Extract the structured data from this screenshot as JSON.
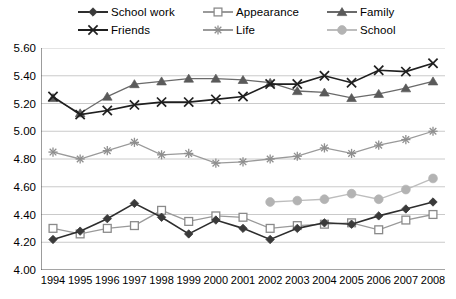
{
  "chart_data": {
    "type": "line",
    "title": "",
    "subtitle": "",
    "xlabel": "",
    "ylabel": "",
    "x": [
      1994,
      1995,
      1996,
      1997,
      1998,
      1999,
      2000,
      2001,
      2002,
      2003,
      2004,
      2005,
      2006,
      2007,
      2008
    ],
    "categories": [
      "1994",
      "1995",
      "1996",
      "1997",
      "1998",
      "1999",
      "2000",
      "2001",
      "2002",
      "2003",
      "2004",
      "2005",
      "2006",
      "2007",
      "2008"
    ],
    "ylim": [
      4.0,
      5.6
    ],
    "yticks": [
      "4.00",
      "4.20",
      "4.40",
      "4.60",
      "4.80",
      "5.00",
      "5.20",
      "5.40",
      "5.60"
    ],
    "ytick_values": [
      4.0,
      4.2,
      4.4,
      4.6,
      4.8,
      5.0,
      5.2,
      5.4,
      5.6
    ],
    "grid": "horizontal",
    "legend_position": "top",
    "series": [
      {
        "name": "School work",
        "marker": "diamond",
        "color": "#3a3a3a",
        "line_color": "#2e2e2e",
        "values": [
          4.22,
          4.28,
          4.37,
          4.48,
          4.38,
          4.26,
          4.36,
          4.3,
          4.22,
          4.3,
          4.34,
          4.33,
          4.39,
          4.44,
          4.49
        ]
      },
      {
        "name": "Appearance",
        "marker": "open-square",
        "color": "#8a8a8a",
        "line_color": "#9a9a9a",
        "values": [
          4.3,
          4.26,
          4.3,
          4.32,
          4.43,
          4.35,
          4.39,
          4.38,
          4.3,
          4.32,
          4.33,
          4.34,
          4.29,
          4.36,
          4.4
        ]
      },
      {
        "name": "Family",
        "marker": "triangle",
        "color": "#5a5a5a",
        "line_color": "#6a6a6a",
        "values": [
          5.24,
          5.13,
          5.25,
          5.34,
          5.36,
          5.38,
          5.38,
          5.37,
          5.35,
          5.29,
          5.28,
          5.24,
          5.27,
          5.31,
          5.36
        ]
      },
      {
        "name": "Friends",
        "marker": "cross-x",
        "color": "#1f1f1f",
        "line_color": "#1f1f1f",
        "values": [
          5.25,
          5.12,
          5.15,
          5.19,
          5.21,
          5.21,
          5.23,
          5.25,
          5.34,
          5.34,
          5.4,
          5.35,
          5.44,
          5.43,
          5.49
        ]
      },
      {
        "name": "Life",
        "marker": "asterisk",
        "color": "#8f8f8f",
        "line_color": "#9a9a9a",
        "values": [
          4.85,
          4.8,
          4.86,
          4.92,
          4.83,
          4.84,
          4.77,
          4.78,
          4.8,
          4.82,
          4.88,
          4.84,
          4.9,
          4.94,
          5.0
        ]
      },
      {
        "name": "School",
        "marker": "circle",
        "color": "#b3b3b3",
        "line_color": "#bdbdbd",
        "values": [
          null,
          null,
          null,
          null,
          null,
          null,
          null,
          null,
          4.49,
          4.5,
          4.51,
          4.55,
          4.51,
          4.58,
          4.66
        ]
      }
    ]
  },
  "legend": {
    "items": [
      {
        "label": "School work",
        "marker": "diamond",
        "icon": "diamond-marker-icon"
      },
      {
        "label": "Appearance",
        "marker": "open-square",
        "icon": "open-square-marker-icon"
      },
      {
        "label": "Family",
        "marker": "triangle",
        "icon": "triangle-marker-icon"
      },
      {
        "label": "Friends",
        "marker": "cross-x",
        "icon": "cross-x-marker-icon"
      },
      {
        "label": "Life",
        "marker": "asterisk",
        "icon": "asterisk-marker-icon"
      },
      {
        "label": "School",
        "marker": "circle",
        "icon": "circle-marker-icon"
      }
    ]
  }
}
